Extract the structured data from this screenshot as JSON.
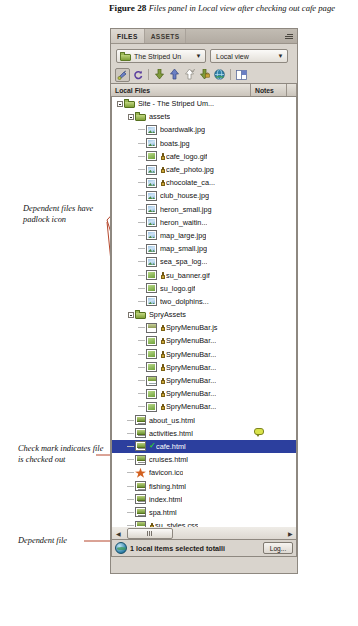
{
  "caption": {
    "figure_number": "Figure 28",
    "text": "Files panel in Local view after checking out cafe page"
  },
  "annotations": [
    {
      "id": "dependent-files",
      "text": "Dependent files have padlock icon"
    },
    {
      "id": "check-mark",
      "text": "Check mark indicates file is checked out"
    },
    {
      "id": "dependent-file",
      "text": "Dependent file"
    }
  ],
  "panel": {
    "tabs": [
      {
        "label": "FILES",
        "active": true
      },
      {
        "label": "ASSETS",
        "active": false
      }
    ],
    "menu_icon": "panel-options-icon",
    "site_combo": {
      "icon": "folder-icon",
      "value": "The Striped Un",
      "arrow": "▼"
    },
    "view_combo": {
      "value": "Local view",
      "arrow": "▼"
    },
    "toolbar": [
      {
        "name": "connect-to-remote-host-icon",
        "glyph": "connect",
        "pressed": true
      },
      {
        "name": "refresh-icon",
        "glyph": "refresh",
        "pressed": false
      },
      {
        "name": "get-files-icon",
        "glyph": "down",
        "pressed": false
      },
      {
        "name": "put-files-icon",
        "glyph": "up",
        "pressed": false
      },
      {
        "name": "check-out-files-icon",
        "glyph": "checkout",
        "pressed": false
      },
      {
        "name": "check-in-files-icon",
        "glyph": "checkin",
        "pressed": false
      },
      {
        "name": "synchronize-icon",
        "glyph": "sync",
        "pressed": false
      },
      {
        "name": "expand-collapse-icon",
        "glyph": "expand",
        "pressed": false
      }
    ],
    "columns": [
      {
        "label": "Local Files"
      },
      {
        "label": "Notes"
      }
    ],
    "files": [
      {
        "label": "Site - The Striped Um...",
        "icon": "folder-icon",
        "depth": 0,
        "twisty": "minus",
        "lock": false,
        "check": false,
        "selected": false,
        "note": false
      },
      {
        "label": "assets",
        "icon": "folder-icon",
        "depth": 1,
        "twisty": "minus",
        "lock": false,
        "check": false,
        "selected": false,
        "note": false
      },
      {
        "label": "boardwalk.jpg",
        "icon": "image-icon",
        "depth": 2,
        "twisty": "none",
        "lock": false,
        "check": false,
        "selected": false,
        "note": false
      },
      {
        "label": "boats.jpg",
        "icon": "image-icon",
        "depth": 2,
        "twisty": "none",
        "lock": false,
        "check": false,
        "selected": false,
        "note": false
      },
      {
        "label": "cafe_logo.gif",
        "icon": "gif-icon",
        "depth": 2,
        "twisty": "none",
        "lock": true,
        "check": false,
        "selected": false,
        "note": false
      },
      {
        "label": "cafe_photo.jpg",
        "icon": "image-icon",
        "depth": 2,
        "twisty": "none",
        "lock": true,
        "check": false,
        "selected": false,
        "note": false
      },
      {
        "label": "chocolate_ca...",
        "icon": "image-icon",
        "depth": 2,
        "twisty": "none",
        "lock": true,
        "check": false,
        "selected": false,
        "note": false
      },
      {
        "label": "club_house.jpg",
        "icon": "image-icon",
        "depth": 2,
        "twisty": "none",
        "lock": false,
        "check": false,
        "selected": false,
        "note": false
      },
      {
        "label": "heron_small.jpg",
        "icon": "image-icon",
        "depth": 2,
        "twisty": "none",
        "lock": false,
        "check": false,
        "selected": false,
        "note": false
      },
      {
        "label": "heron_waitin...",
        "icon": "image-icon",
        "depth": 2,
        "twisty": "none",
        "lock": false,
        "check": false,
        "selected": false,
        "note": false
      },
      {
        "label": "map_large.jpg",
        "icon": "image-icon",
        "depth": 2,
        "twisty": "none",
        "lock": false,
        "check": false,
        "selected": false,
        "note": false
      },
      {
        "label": "map_small.jpg",
        "icon": "image-icon",
        "depth": 2,
        "twisty": "none",
        "lock": false,
        "check": false,
        "selected": false,
        "note": false
      },
      {
        "label": "sea_spa_log...",
        "icon": "image-icon",
        "depth": 2,
        "twisty": "none",
        "lock": false,
        "check": false,
        "selected": false,
        "note": false
      },
      {
        "label": "su_banner.gif",
        "icon": "gif-icon",
        "depth": 2,
        "twisty": "none",
        "lock": true,
        "check": false,
        "selected": false,
        "note": false
      },
      {
        "label": "su_logo.gif",
        "icon": "gif-icon",
        "depth": 2,
        "twisty": "none",
        "lock": false,
        "check": false,
        "selected": false,
        "note": false
      },
      {
        "label": "two_dolphins...",
        "icon": "image-icon",
        "depth": 2,
        "twisty": "none",
        "lock": false,
        "check": false,
        "selected": false,
        "note": false
      },
      {
        "label": "SpryAssets",
        "icon": "folder-icon",
        "depth": 1,
        "twisty": "minus",
        "lock": false,
        "check": false,
        "selected": false,
        "note": false
      },
      {
        "label": "SpryMenuBar.js",
        "icon": "js-icon",
        "depth": 2,
        "twisty": "none",
        "lock": true,
        "check": false,
        "selected": false,
        "note": false
      },
      {
        "label": "SpryMenuBar...",
        "icon": "gif-icon",
        "depth": 2,
        "twisty": "none",
        "lock": true,
        "check": false,
        "selected": false,
        "note": false
      },
      {
        "label": "SpryMenuBar...",
        "icon": "gif-icon",
        "depth": 2,
        "twisty": "none",
        "lock": true,
        "check": false,
        "selected": false,
        "note": false
      },
      {
        "label": "SpryMenuBar...",
        "icon": "gif-icon",
        "depth": 2,
        "twisty": "none",
        "lock": true,
        "check": false,
        "selected": false,
        "note": false
      },
      {
        "label": "SpryMenuBar...",
        "icon": "css-icon",
        "depth": 2,
        "twisty": "none",
        "lock": true,
        "check": false,
        "selected": false,
        "note": false
      },
      {
        "label": "SpryMenuBar...",
        "icon": "gif-icon",
        "depth": 2,
        "twisty": "none",
        "lock": true,
        "check": false,
        "selected": false,
        "note": false
      },
      {
        "label": "SpryMenuBar...",
        "icon": "gif-icon",
        "depth": 2,
        "twisty": "none",
        "lock": true,
        "check": false,
        "selected": false,
        "note": false
      },
      {
        "label": "about_us.html",
        "icon": "html-icon",
        "depth": 1,
        "twisty": "none",
        "lock": false,
        "check": false,
        "selected": false,
        "note": false
      },
      {
        "label": "activities.html",
        "icon": "html-icon",
        "depth": 1,
        "twisty": "none",
        "lock": false,
        "check": false,
        "selected": false,
        "note": true
      },
      {
        "label": "cafe.html",
        "icon": "html-icon",
        "depth": 1,
        "twisty": "none",
        "lock": false,
        "check": true,
        "selected": true,
        "note": false
      },
      {
        "label": "cruises.html",
        "icon": "html-icon",
        "depth": 1,
        "twisty": "none",
        "lock": false,
        "check": false,
        "selected": false,
        "note": false
      },
      {
        "label": "favicon.ico",
        "icon": "star-icon",
        "depth": 1,
        "twisty": "none",
        "lock": false,
        "check": false,
        "selected": false,
        "note": false
      },
      {
        "label": "fishing.html",
        "icon": "html-icon",
        "depth": 1,
        "twisty": "none",
        "lock": false,
        "check": false,
        "selected": false,
        "note": false
      },
      {
        "label": "index.html",
        "icon": "html-icon",
        "depth": 1,
        "twisty": "none",
        "lock": false,
        "check": false,
        "selected": false,
        "note": false
      },
      {
        "label": "spa.html",
        "icon": "html-icon",
        "depth": 1,
        "twisty": "none",
        "lock": false,
        "check": false,
        "selected": false,
        "note": false
      },
      {
        "label": "su_styles.css",
        "icon": "css-icon",
        "depth": 1,
        "twisty": "none",
        "lock": true,
        "check": false,
        "selected": false,
        "note": false
      }
    ],
    "hscrollbar": {
      "left_arrow": "◀",
      "right_arrow": "▶"
    },
    "statusbar": {
      "icon": "globe-icon",
      "text": "1 local items selected totalli",
      "log_button": "Log..."
    }
  },
  "colors": {
    "selection": "#2c3f9e",
    "panel_bg": "#d9d4cd",
    "leader": "#b5472c",
    "check": "#2ecd2e"
  }
}
